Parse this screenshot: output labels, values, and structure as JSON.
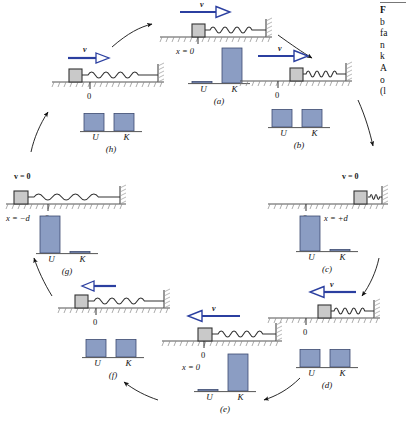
{
  "figure": {
    "colors": {
      "bar_fill": "#8b9dc3",
      "bar_stroke": "#3c4a70",
      "velocity_arrow": "#2b3fa0",
      "ground": "#555555",
      "block_fill": "#c9c9c9",
      "spring": "#333333"
    },
    "axis_baseline_label": "0"
  },
  "caption": {
    "rule": true,
    "lines": [
      "F",
      "b",
      "fa",
      "n",
      "k",
      "A",
      "o",
      "(l"
    ]
  },
  "labels": {
    "U": "U",
    "K": "K",
    "zero": "0",
    "x_zero": "x = 0",
    "x_plus_d": "x = +d",
    "x_minus_d": "x = −d",
    "v": "v",
    "v_zero": "v = 0"
  },
  "chart_data": {
    "type": "bar",
    "categories": [
      "U",
      "K"
    ],
    "ylabel": "Energy",
    "ylim": [
      0,
      1
    ],
    "grid": false,
    "legend": null,
    "series": [
      {
        "name": "(a)",
        "values": [
          0.03,
          1.0
        ]
      },
      {
        "name": "(b)",
        "values": [
          0.5,
          0.5
        ]
      },
      {
        "name": "(c)",
        "values": [
          1.0,
          0.03
        ]
      },
      {
        "name": "(d)",
        "values": [
          0.5,
          0.5
        ]
      },
      {
        "name": "(e)",
        "values": [
          0.03,
          1.0
        ]
      },
      {
        "name": "(f)",
        "values": [
          0.5,
          0.5
        ]
      },
      {
        "name": "(g)",
        "values": [
          1.0,
          0.03
        ]
      },
      {
        "name": "(h)",
        "values": [
          0.5,
          0.5
        ]
      }
    ]
  },
  "panels": [
    {
      "id": "a",
      "letter": "(a)",
      "velocity": {
        "shown": true,
        "direction": "right",
        "label": "v",
        "zero": false
      },
      "position_label": "x = 0",
      "position_label_side": "left",
      "zero_mark": false,
      "block_pos": "center",
      "spring": "natural",
      "bars": {
        "U": 0.03,
        "K": 1.0
      }
    },
    {
      "id": "b",
      "letter": "(b)",
      "velocity": {
        "shown": true,
        "direction": "right",
        "label": "v",
        "zero": false
      },
      "position_label": "",
      "position_label_side": "left",
      "zero_mark": true,
      "block_pos": "center-right",
      "spring": "compressed",
      "bars": {
        "U": 0.5,
        "K": 0.5
      }
    },
    {
      "id": "c",
      "letter": "(c)",
      "velocity": {
        "shown": false,
        "direction": "none",
        "label": "v = 0",
        "zero": true
      },
      "position_label": "x = +d",
      "position_label_side": "right",
      "zero_mark": true,
      "block_pos": "right",
      "spring": "fully-compressed",
      "bars": {
        "U": 1.0,
        "K": 0.03
      }
    },
    {
      "id": "d",
      "letter": "(d)",
      "velocity": {
        "shown": true,
        "direction": "left",
        "label": "v",
        "zero": false
      },
      "position_label": "",
      "position_label_side": "left",
      "zero_mark": true,
      "block_pos": "center-right",
      "spring": "compressed",
      "bars": {
        "U": 0.5,
        "K": 0.5
      }
    },
    {
      "id": "e",
      "letter": "(e)",
      "velocity": {
        "shown": true,
        "direction": "left",
        "label": "v",
        "zero": false
      },
      "position_label": "x = 0",
      "position_label_side": "left",
      "zero_mark": true,
      "block_pos": "center",
      "spring": "natural",
      "bars": {
        "U": 0.03,
        "K": 1.0
      }
    },
    {
      "id": "f",
      "letter": "(f)",
      "velocity": {
        "shown": true,
        "direction": "left",
        "label": "v",
        "zero": false
      },
      "position_label": "",
      "position_label_side": "left",
      "zero_mark": true,
      "block_pos": "center-left",
      "spring": "stretched",
      "bars": {
        "U": 0.5,
        "K": 0.5
      }
    },
    {
      "id": "g",
      "letter": "(g)",
      "velocity": {
        "shown": false,
        "direction": "none",
        "label": "v = 0",
        "zero": true
      },
      "position_label": "x = −d",
      "position_label_side": "left",
      "zero_mark": true,
      "block_pos": "left",
      "spring": "fully-stretched",
      "bars": {
        "U": 1.0,
        "K": 0.03
      }
    },
    {
      "id": "h",
      "letter": "(h)",
      "velocity": {
        "shown": true,
        "direction": "right",
        "label": "v",
        "zero": false
      },
      "position_label": "",
      "position_label_side": "left",
      "zero_mark": true,
      "block_pos": "center-left",
      "spring": "stretched",
      "bars": {
        "U": 0.5,
        "K": 0.5
      }
    }
  ]
}
